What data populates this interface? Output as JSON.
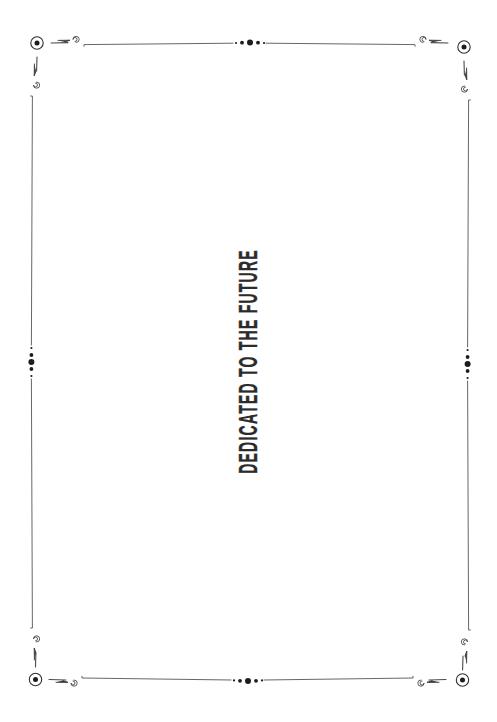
{
  "page": {
    "kind": "book-dedication-page",
    "background_color": "#ffffff"
  },
  "dedication": {
    "text": "DEDICATED TO THE FUTURE",
    "orientation": "rotated-90-counterclockwise",
    "color": "#2b2b2b"
  },
  "ornament": {
    "stroke_color": "#4a4a52",
    "accent_color": "#1d1d1d",
    "frame": {
      "left": 36,
      "top": 44,
      "right": 463,
      "bottom": 680
    },
    "corners": [
      {
        "name": "top-left",
        "x": 37,
        "y": 43
      },
      {
        "name": "top-right",
        "x": 464,
        "y": 47
      },
      {
        "name": "bottom-left",
        "x": 35,
        "y": 679
      },
      {
        "name": "bottom-right",
        "x": 462,
        "y": 682
      }
    ],
    "midpoint_clusters": [
      {
        "name": "top-center",
        "x": 250,
        "y": 42,
        "axis": "horizontal"
      },
      {
        "name": "bottom-center",
        "x": 248,
        "y": 681,
        "axis": "horizontal"
      },
      {
        "name": "left-center",
        "x": 31,
        "y": 362,
        "axis": "vertical"
      },
      {
        "name": "right-center",
        "x": 466,
        "y": 364,
        "axis": "vertical"
      }
    ],
    "dot_cluster_sizes": [
      1.1,
      1.9,
      3.1,
      1.9,
      1.1
    ]
  }
}
